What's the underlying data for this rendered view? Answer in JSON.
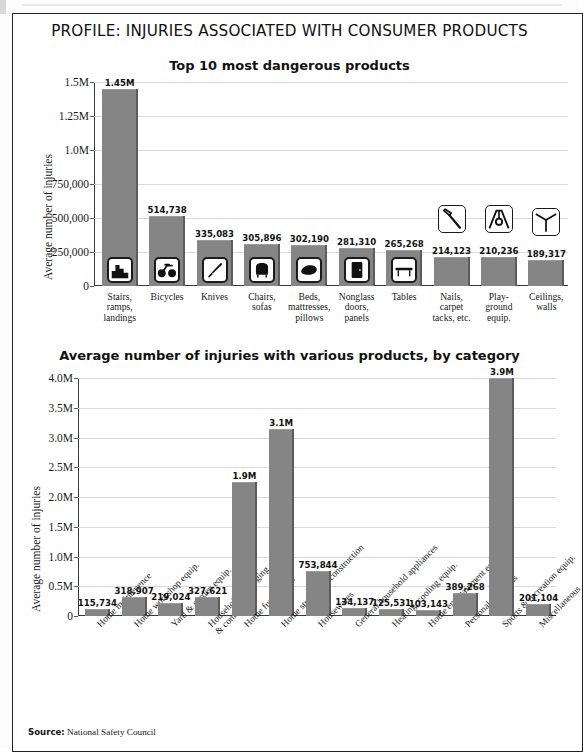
{
  "headline": "PROFILE: INJURIES ASSOCIATED WITH CONSUMER PRODUCTS",
  "source": {
    "label": "Source:",
    "text": "National Safety Council"
  },
  "chart_data": [
    {
      "type": "bar",
      "title": "Top 10 most dangerous products",
      "ylabel": "Average number of injuries",
      "xlabel": "",
      "ylim": [
        0,
        1500000
      ],
      "grid": true,
      "ytick_labels": [
        "1.5M",
        "1.25M",
        "1.0M",
        "750,000",
        "500,000",
        "250,000",
        "0"
      ],
      "ytick_values": [
        1500000,
        1250000,
        1000000,
        750000,
        500000,
        250000,
        0
      ],
      "categories": [
        "Stairs, ramps, landings",
        "Bicycles",
        "Knives",
        "Chairs, sofas",
        "Beds, mattresses, pillows",
        "Nonglass doors, panels",
        "Tables",
        "Nails, carpet tacks, etc.",
        "Play-ground equip.",
        "Ceilings, walls"
      ],
      "category_lines": [
        [
          "Stairs,",
          "ramps,",
          "landings"
        ],
        [
          "Bicycles"
        ],
        [
          "Knives"
        ],
        [
          "Chairs,",
          "sofas"
        ],
        [
          "Beds,",
          "mattresses,",
          "pillows"
        ],
        [
          "Nonglass",
          "doors,",
          "panels"
        ],
        [
          "Tables"
        ],
        [
          "Nails,",
          "carpet",
          "tacks, etc."
        ],
        [
          "Play-",
          "ground",
          "equip."
        ],
        [
          "Ceilings,",
          "walls"
        ]
      ],
      "values": [
        1450000,
        514738,
        335083,
        305896,
        302190,
        281310,
        265268,
        214123,
        210236,
        189317
      ],
      "value_labels": [
        "1.45M",
        "514,738",
        "335,083",
        "305,896",
        "302,190",
        "281,310",
        "265,268",
        "214,123",
        "210,236",
        "189,317"
      ],
      "icons": [
        "stairs-icon",
        "bicycle-icon",
        "knife-icon",
        "chair-icon",
        "bed-pillow-icon",
        "door-icon",
        "table-icon",
        "hammer-icon",
        "swing-icon",
        "ceiling-corner-icon"
      ]
    },
    {
      "type": "bar",
      "title": "Average number of injuries with various products, by category",
      "ylabel": "Average number of injuries",
      "xlabel": "",
      "ylim": [
        0,
        4000000
      ],
      "grid": true,
      "ytick_labels": [
        "4.0M",
        "3.5M",
        "3.0M",
        "2.5M",
        "2.0M",
        "1.5M",
        "1.0M",
        "0.5M",
        "0"
      ],
      "ytick_values": [
        4000000,
        3500000,
        3000000,
        2500000,
        2000000,
        1500000,
        1000000,
        500000,
        0
      ],
      "categories": [
        "Home maintenence",
        "Home workshop equip.",
        "Yard & garden equip.",
        "Household packaging & containers",
        "Home furnishings",
        "Home structures, construction",
        "Housewares",
        "General household appliances",
        "Heating, cooling equip.",
        "Home entertainment equip.",
        "Personal use items",
        "Sports & recreation equip.",
        "Miscellaneous"
      ],
      "category_lines": [
        [
          "Home maintenence"
        ],
        [
          "Home workshop equip."
        ],
        [
          "Yard & garden equip."
        ],
        [
          "Household packaging",
          "& containers"
        ],
        [
          "Home furnishings"
        ],
        [
          "Home structures, construction"
        ],
        [
          "Housewares"
        ],
        [
          "General household appliances"
        ],
        [
          "Heating, cooling equip."
        ],
        [
          "Home entertainment equip."
        ],
        [
          "Personal use items"
        ],
        [
          "Sports & recreation equip."
        ],
        [
          "Miscellaneous"
        ]
      ],
      "values": [
        115734,
        318907,
        219024,
        327621,
        2250000,
        3150000,
        753844,
        134137,
        125531,
        103143,
        389268,
        4000000,
        201104
      ],
      "value_labels": [
        "115,734",
        "318,907",
        "219,024",
        "327,621",
        "1.9M",
        "3.1M",
        "753,844",
        "134,137",
        "125,531",
        "103,143",
        "389,268",
        "3.9M",
        "201,104"
      ]
    }
  ]
}
